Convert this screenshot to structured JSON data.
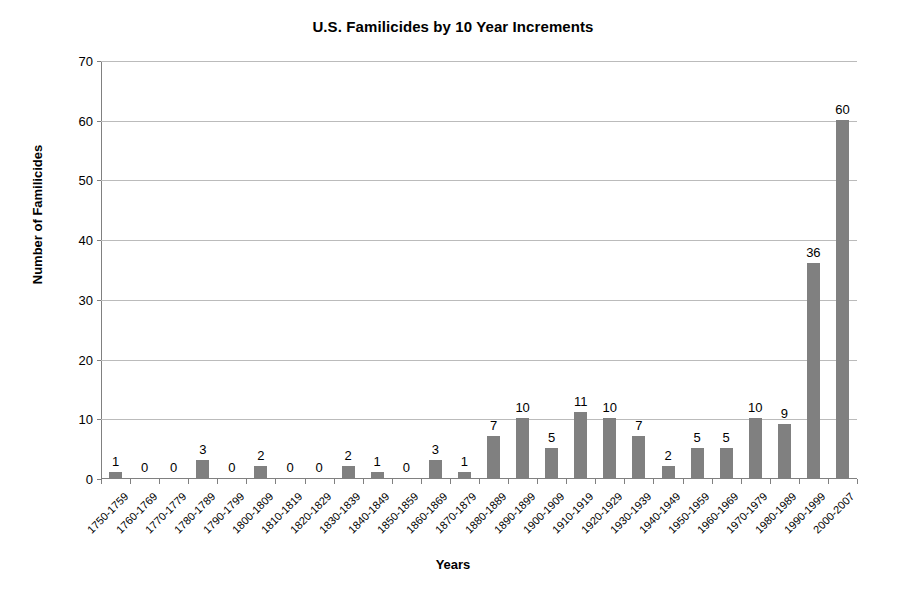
{
  "chart_data": {
    "type": "bar",
    "title": "U.S. Familicides by 10 Year Increments",
    "xlabel": "Years",
    "ylabel": "Number of Familicides",
    "ylim": [
      0,
      70
    ],
    "ytick_step": 10,
    "yticks": [
      0,
      10,
      20,
      30,
      40,
      50,
      60,
      70
    ],
    "grid": true,
    "legend": "none",
    "bar_color": "#808080",
    "show_data_labels": true,
    "categories": [
      "1750-1759",
      "1760-1769",
      "1770-1779",
      "1780-1789",
      "1790-1799",
      "1800-1809",
      "1810-1819",
      "1820-1829",
      "1830-1839",
      "1840-1849",
      "1850-1859",
      "1860-1869",
      "1870-1879",
      "1880-1889",
      "1890-1899",
      "1900-1909",
      "1910-1919",
      "1920-1929",
      "1930-1939",
      "1940-1949",
      "1950-1959",
      "1960-1969",
      "1970-1979",
      "1980-1989",
      "1990-1999",
      "2000-2007"
    ],
    "values": [
      1,
      0,
      0,
      3,
      0,
      2,
      0,
      0,
      2,
      1,
      0,
      3,
      1,
      7,
      10,
      5,
      11,
      10,
      7,
      2,
      5,
      5,
      10,
      9,
      36,
      60
    ]
  }
}
